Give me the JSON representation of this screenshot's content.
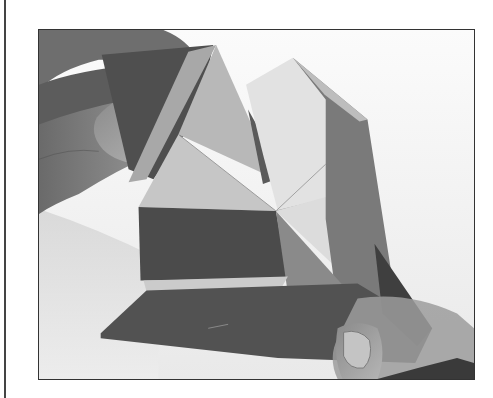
{
  "photo": {
    "subject": "hands folding origami paper",
    "palette": {
      "background": "#f7f7f7",
      "skin_dark": "#5a5a5a",
      "skin_mid": "#8c8c8c",
      "skin_light": "#bdbdbd",
      "paper_dark": "#4d4d4d",
      "paper_mid": "#7b7b7b",
      "paper_light": "#bfbfbf",
      "paper_white": "#e4e4e4",
      "frame": "#333333"
    }
  }
}
